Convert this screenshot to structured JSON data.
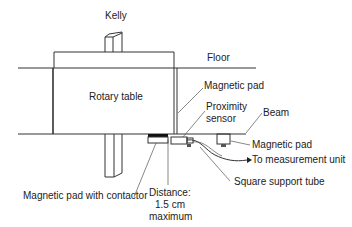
{
  "figure": {
    "type": "technical-diagram",
    "labels": {
      "kelly": "Kelly",
      "floor": "Floor",
      "rotary_table": "Rotary table",
      "magnetic_pad_top": "Magnetic pad",
      "proximity_sensor_line1": "Proximity",
      "proximity_sensor_line2": "sensor",
      "beam": "Beam",
      "magnetic_pad_right": "Magnetic pad",
      "to_measurement_unit": "To measurement unit",
      "square_support_tube": "Square support tube",
      "magnetic_pad_with_contactor": "Magnetic pad with contactor",
      "distance_line1": "Distance:",
      "distance_line2": "1.5 cm",
      "distance_line3": "maximum"
    }
  }
}
